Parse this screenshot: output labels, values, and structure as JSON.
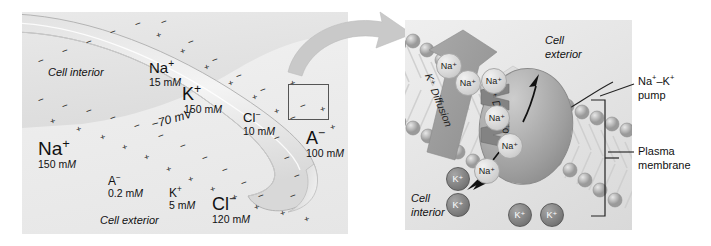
{
  "figure": {
    "type": "cell-membrane-diagram"
  },
  "left_panel": {
    "name": "whole-cell-overview",
    "compartments": {
      "interior": "Cell interior",
      "exterior": "Cell exterior"
    },
    "membrane_potential": "−70 mV",
    "interior_ions": [
      {
        "id": "na-in",
        "species": "Na",
        "charge": "+",
        "conc_value": "15",
        "conc_unit": "mM"
      },
      {
        "id": "k-in",
        "species": "K",
        "charge": "+",
        "conc_value": "150",
        "conc_unit": "mM"
      },
      {
        "id": "cl-in",
        "species": "Cl",
        "charge": "−",
        "conc_value": "10",
        "conc_unit": "mM"
      },
      {
        "id": "a-in",
        "species": "A",
        "charge": "−",
        "conc_value": "100",
        "conc_unit": "mM"
      }
    ],
    "exterior_ions": [
      {
        "id": "na-out",
        "species": "Na",
        "charge": "+",
        "conc_value": "150",
        "conc_unit": "mM"
      },
      {
        "id": "a-out",
        "species": "A",
        "charge": "−",
        "conc_value": "0.2",
        "conc_unit": "mM"
      },
      {
        "id": "k-out",
        "species": "K",
        "charge": "+",
        "conc_value": "5",
        "conc_unit": "mM"
      },
      {
        "id": "cl-out",
        "species": "Cl",
        "charge": "−",
        "conc_value": "120",
        "conc_unit": "mM"
      }
    ],
    "inset_box_label": "magnified-region",
    "charge_inner": "−",
    "charge_outer": "+"
  },
  "right_panel": {
    "name": "membrane-closeup",
    "compartments": {
      "exterior": "Cell exterior",
      "interior": "Cell interior"
    },
    "diffusion_arrows": [
      {
        "id": "k-diffusion",
        "label": "K⁺ Diffusion",
        "ion": "K",
        "direction": "inward-down-left"
      },
      {
        "id": "na-diffusion",
        "label": "Na⁺ Diffusion",
        "ion": "Na",
        "direction": "inward-down-left"
      }
    ],
    "callouts": [
      {
        "id": "pump-callout",
        "line1": "Na⁺–K⁺",
        "line2": "pump"
      },
      {
        "id": "membrane-callout",
        "line1": "Plasma",
        "line2": "membrane"
      }
    ],
    "ions": [
      {
        "id": "na-ext-1",
        "label": "Na⁺",
        "type": "Na",
        "x": 43,
        "y": 45,
        "d": 24
      },
      {
        "id": "na-ext-2",
        "label": "Na⁺",
        "type": "Na",
        "x": 62,
        "y": 62,
        "d": 24
      },
      {
        "id": "na-ext-3",
        "label": "Na⁺",
        "type": "Na",
        "x": 88,
        "y": 60,
        "d": 24
      },
      {
        "id": "na-pump-1",
        "label": "Na⁺",
        "type": "Na",
        "x": 91,
        "y": 97,
        "d": 24
      },
      {
        "id": "na-pump-2",
        "label": "Na⁺",
        "type": "Na",
        "x": 104,
        "y": 125,
        "d": 24
      },
      {
        "id": "na-pump-3",
        "label": "Na⁺",
        "type": "Na",
        "x": 81,
        "y": 150,
        "d": 24
      },
      {
        "id": "k-int-1",
        "label": "K⁺",
        "type": "K",
        "x": 52,
        "y": 158,
        "d": 22
      },
      {
        "id": "k-int-2",
        "label": "K⁺",
        "type": "K",
        "x": 52,
        "y": 184,
        "d": 22
      },
      {
        "id": "k-int-3",
        "label": "K⁺",
        "type": "K",
        "x": 114,
        "y": 194,
        "d": 22
      },
      {
        "id": "k-int-4",
        "label": "K⁺",
        "type": "K",
        "x": 146,
        "y": 194,
        "d": 22
      }
    ]
  },
  "colors": {
    "panel_bg_left": "#eeeeee",
    "panel_bg_right": "#e5e5e5",
    "ink": "#111111",
    "pump_gray": "#9e9e9e",
    "k_ion_gray": "#777777",
    "na_ion_gray": "#d4d4d4",
    "arrow_gray": "#b9b9b9",
    "membrane_stroke": "#8a8a8a"
  }
}
